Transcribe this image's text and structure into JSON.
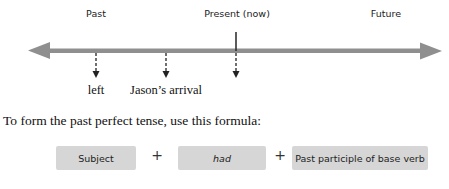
{
  "timeline": {
    "labels": {
      "past": "Past",
      "present": "Present (now)",
      "future": "Future"
    },
    "line_color": "#8f8f8f",
    "events": [
      {
        "label": "left"
      },
      {
        "label": "Jason’s arrival"
      },
      {
        "label": ""
      }
    ]
  },
  "instruction": "To form the past perfect tense, use this formula:",
  "formula": {
    "parts": [
      "Subject",
      "had",
      "Past participle of base verb"
    ],
    "operator": "+",
    "box_color": "#d6d6d6"
  }
}
